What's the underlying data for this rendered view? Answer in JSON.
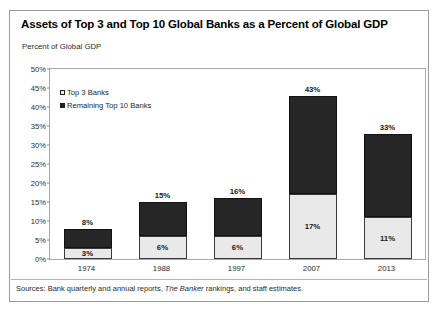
{
  "chart_data": {
    "type": "bar",
    "stacked": true,
    "title": "Assets of Top 3 and Top 10 Global Banks as a Percent of Global GDP",
    "subtitle": "Percent of Global GDP",
    "xlabel": "",
    "ylabel": "Percent of Global GDP",
    "ylim": [
      0,
      50
    ],
    "ytick_labels": [
      "0%",
      "5%",
      "10%",
      "15%",
      "20%",
      "25%",
      "30%",
      "35%",
      "40%",
      "45%",
      "50%"
    ],
    "ytick_values": [
      0,
      5,
      10,
      15,
      20,
      25,
      30,
      35,
      40,
      45,
      50
    ],
    "grid": false,
    "legend_position": "inside-top-left",
    "categories": [
      "1974",
      "1988",
      "1997",
      "2007",
      "2013"
    ],
    "series": [
      {
        "name": "Top 3 Banks",
        "color": "#e9e9e9",
        "values": [
          3,
          6,
          6,
          17,
          11
        ],
        "value_labels": [
          "3%",
          "6%",
          "6%",
          "17%",
          "11%"
        ]
      },
      {
        "name": "Remaining Top 10 Banks",
        "color": "#262626",
        "values": [
          5,
          9,
          10,
          26,
          22
        ],
        "value_labels": [
          "",
          "",
          "",
          "",
          ""
        ]
      }
    ],
    "totals": [
      8,
      15,
      16,
      43,
      33
    ],
    "total_labels": [
      "8%",
      "15%",
      "16%",
      "43%",
      "33%"
    ],
    "source_note_prefix": "Sources: Bank quarterly and annual reports, ",
    "source_note_italic": "The Banker",
    "source_note_suffix": " rankings, and staff estimates."
  }
}
